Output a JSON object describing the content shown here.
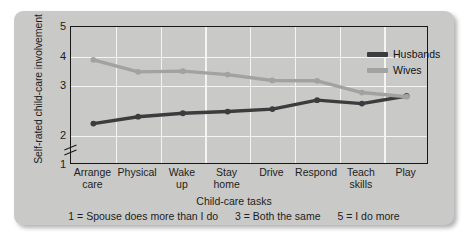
{
  "chart_data": {
    "type": "line",
    "title": "",
    "xlabel": "Child-care tasks",
    "ylabel": "Self-rated child-care involvement",
    "categories": [
      "Arrange care",
      "Physical",
      "Wake up",
      "Stay home",
      "Drive",
      "Respond",
      "Teach skills",
      "Play"
    ],
    "category_lines": [
      [
        "Arrange",
        "care"
      ],
      [
        "Physical",
        ""
      ],
      [
        "Wake",
        "up"
      ],
      [
        "Stay",
        "home"
      ],
      [
        "Drive",
        ""
      ],
      [
        "Respond",
        ""
      ],
      [
        "Teach",
        "skills"
      ],
      [
        "Play",
        ""
      ]
    ],
    "series": [
      {
        "name": "Husbands",
        "color": "#3c3c3e",
        "values": [
          2.2,
          2.4,
          2.5,
          2.55,
          2.62,
          2.88,
          2.78,
          3.0
        ]
      },
      {
        "name": "Wives",
        "color": "#a2a2a0",
        "values": [
          4.05,
          3.7,
          3.72,
          3.62,
          3.45,
          3.44,
          3.1,
          2.98
        ]
      }
    ],
    "ylim": [
      1,
      5
    ],
    "yticks": [
      1,
      2,
      3,
      4,
      5
    ],
    "ytick_labels": [
      "1",
      "2",
      "3",
      "4",
      "5"
    ],
    "axis_break_between": [
      1,
      2
    ],
    "grid": true,
    "legend_position": "top-right",
    "annotations": [
      "1 = Spouse does more than I do",
      "3 = Both the same",
      "5 = I do more"
    ]
  },
  "figure": {
    "background_color": "#c9c9c7",
    "grid_color": "#f4f4f2",
    "axis_color": "#17171a"
  }
}
